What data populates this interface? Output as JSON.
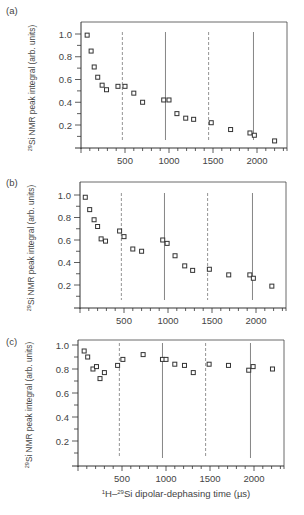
{
  "chart_data": [
    {
      "type": "scatter",
      "panel_label": "(a)",
      "xlabel": "",
      "ylabel": "29Si NMR peak integral (arb. units)",
      "xlim": [
        0,
        2300
      ],
      "ylim": [
        0,
        1.1
      ],
      "xticks": [
        500,
        1000,
        1500,
        2000
      ],
      "yticks": [
        0.2,
        0.4,
        0.6,
        0.8,
        1.0
      ],
      "grid": false,
      "marker": "open-square",
      "vertical_lines": [
        {
          "x": 470,
          "style": "dashed"
        },
        {
          "x": 960,
          "style": "solid"
        },
        {
          "x": 1450,
          "style": "dashed"
        },
        {
          "x": 1960,
          "style": "solid"
        }
      ],
      "series": [
        {
          "name": "data",
          "x": [
            70,
            115,
            150,
            190,
            240,
            290,
            420,
            500,
            600,
            700,
            940,
            1000,
            1090,
            1190,
            1280,
            1480,
            1700,
            1920,
            1970,
            2200
          ],
          "y": [
            0.99,
            0.85,
            0.71,
            0.62,
            0.55,
            0.51,
            0.54,
            0.54,
            0.48,
            0.4,
            0.42,
            0.42,
            0.3,
            0.26,
            0.25,
            0.22,
            0.16,
            0.13,
            0.11,
            0.06
          ]
        }
      ]
    },
    {
      "type": "scatter",
      "panel_label": "(b)",
      "xlabel": "",
      "ylabel": "29Si NMR peak integral (arb. units)",
      "xlim": [
        0,
        2300
      ],
      "ylim": [
        0,
        1.1
      ],
      "xticks": [
        500,
        1000,
        1500,
        2000
      ],
      "yticks": [
        0.2,
        0.4,
        0.6,
        0.8,
        1.0
      ],
      "grid": false,
      "marker": "open-square",
      "vertical_lines": [
        {
          "x": 470,
          "style": "dashed"
        },
        {
          "x": 960,
          "style": "solid"
        },
        {
          "x": 1450,
          "style": "dashed"
        },
        {
          "x": 1960,
          "style": "solid"
        }
      ],
      "series": [
        {
          "name": "data",
          "x": [
            60,
            110,
            160,
            200,
            240,
            290,
            450,
            500,
            600,
            700,
            940,
            990,
            1080,
            1190,
            1280,
            1470,
            1690,
            1930,
            1970,
            2180
          ],
          "y": [
            0.98,
            0.87,
            0.78,
            0.72,
            0.61,
            0.59,
            0.68,
            0.63,
            0.52,
            0.5,
            0.6,
            0.57,
            0.46,
            0.37,
            0.33,
            0.34,
            0.29,
            0.29,
            0.26,
            0.19
          ]
        }
      ]
    },
    {
      "type": "scatter",
      "panel_label": "(c)",
      "xlabel": "1H–29Si dipolar-dephasing time (µs)",
      "ylabel": "29Si NMR peak integral (arb. units)",
      "xlim": [
        0,
        2300
      ],
      "ylim": [
        0,
        1.05
      ],
      "xticks": [
        500,
        1000,
        1500,
        2000
      ],
      "yticks": [
        0.2,
        0.4,
        0.6,
        0.8,
        1.0
      ],
      "grid": false,
      "marker": "open-square",
      "vertical_lines": [
        {
          "x": 470,
          "style": "dashed"
        },
        {
          "x": 960,
          "style": "solid"
        },
        {
          "x": 1450,
          "style": "dashed"
        },
        {
          "x": 1960,
          "style": "solid"
        }
      ],
      "series": [
        {
          "name": "data",
          "x": [
            70,
            110,
            170,
            210,
            250,
            300,
            450,
            510,
            740,
            960,
            1000,
            1100,
            1210,
            1310,
            1490,
            1710,
            1940,
            1990,
            2210
          ],
          "y": [
            0.95,
            0.9,
            0.8,
            0.82,
            0.72,
            0.77,
            0.83,
            0.88,
            0.92,
            0.88,
            0.88,
            0.84,
            0.83,
            0.77,
            0.84,
            0.83,
            0.79,
            0.82,
            0.8
          ]
        }
      ]
    }
  ],
  "labels": {
    "panel_a": "(a)",
    "panel_b": "(b)",
    "panel_c": "(c)",
    "ylabel_sup": "29",
    "ylabel_text": "Si NMR peak integral (arb. units)",
    "xlabel_sup1": "1",
    "xlabel_part1": "H–",
    "xlabel_sup2": "29",
    "xlabel_part2": "Si dipolar-dephasing time (µs)"
  }
}
